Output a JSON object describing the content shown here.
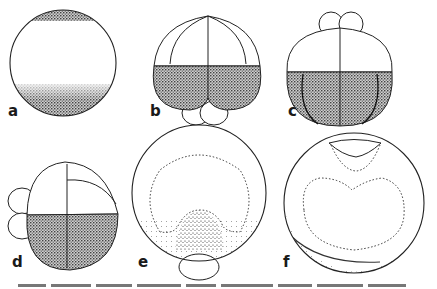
{
  "figure": {
    "panels": [
      {
        "id": "a",
        "label": "a",
        "description": "uncleaved egg with pigmented animal cap and stippled vegetal half"
      },
      {
        "id": "b",
        "label": "b",
        "description": "8-cell stage, large stippled vegetal blastomeres with small cells below"
      },
      {
        "id": "c",
        "label": "c",
        "description": "16-cell stage, small micromeres on top, stippled vegetal tier with furrows"
      },
      {
        "id": "d",
        "label": "d",
        "description": "lateral view of cleaving embryo with small cells at left"
      },
      {
        "id": "e",
        "label": "e",
        "description": "section with dotted outline and dense stippled region above basal cell"
      },
      {
        "id": "f",
        "label": "f",
        "description": "section with cap at top and dotted heart-shaped inner outline"
      }
    ],
    "colors": {
      "ink": "#1a1a1a",
      "background": "#ffffff"
    }
  }
}
